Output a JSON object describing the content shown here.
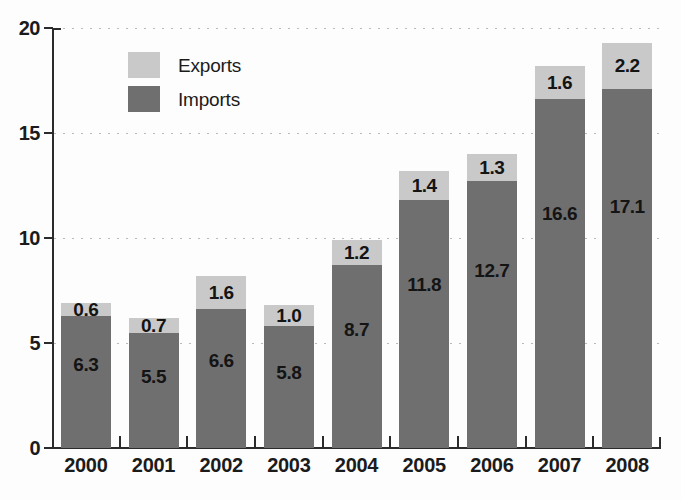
{
  "chart_data": {
    "type": "bar",
    "subtype": "stacked-vertical",
    "title": "",
    "xlabel": "",
    "ylabel": "",
    "ylim": [
      0,
      20
    ],
    "yticks": [
      0,
      5,
      10,
      15,
      20
    ],
    "ytick_labels": [
      "0",
      "5",
      "10",
      "15",
      "20"
    ],
    "grid": "horizontal-dotted",
    "legend_position": "upper-left-inside",
    "categories": [
      "2000",
      "2001",
      "2002",
      "2003",
      "2004",
      "2005",
      "2006",
      "2007",
      "2008"
    ],
    "series": [
      {
        "name": "Imports",
        "color": "#6f6f6f",
        "values": [
          6.3,
          5.5,
          6.6,
          5.8,
          8.7,
          11.8,
          12.7,
          16.6,
          17.1
        ],
        "labels": [
          "6.3",
          "5.5",
          "6.6",
          "5.8",
          "8.7",
          "11.8",
          "12.7",
          "16.6",
          "17.1"
        ]
      },
      {
        "name": "Exports",
        "color": "#c9c9c9",
        "values": [
          0.6,
          0.7,
          1.6,
          1.0,
          1.2,
          1.4,
          1.3,
          1.6,
          2.2
        ],
        "labels": [
          "0.6",
          "0.7",
          "1.6",
          "1.0",
          "1.2",
          "1.4",
          "1.3",
          "1.6",
          "2.2"
        ]
      }
    ],
    "totals": [
      6.9,
      6.2,
      8.2,
      6.8,
      9.9,
      13.2,
      14.0,
      18.2,
      19.3
    ]
  },
  "legend": {
    "items": [
      {
        "label": "Exports",
        "color": "#c9c9c9"
      },
      {
        "label": "Imports",
        "color": "#6f6f6f"
      }
    ]
  },
  "colors": {
    "exports": "#c9c9c9",
    "imports": "#6f6f6f",
    "axis": "#2b2b2b",
    "grid": "#b9b9b9",
    "text": "#1b1b1b",
    "background": "#fdfdfd"
  }
}
